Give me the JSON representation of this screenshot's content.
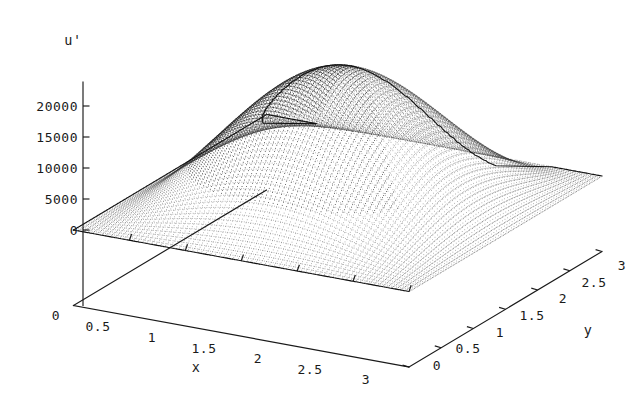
{
  "figure": {
    "kind": "3d-surface-plot",
    "style": "dotted-mesh",
    "background_color": "#ffffff",
    "ink_color": "#1a1a1a"
  },
  "zaxis": {
    "title": "u'",
    "ticks": [
      "20000",
      "15000",
      "10000",
      "5000",
      "0"
    ],
    "tick_values": [
      20000,
      15000,
      10000,
      5000,
      0
    ],
    "range": [
      0,
      20000
    ]
  },
  "xaxis": {
    "title": "x",
    "origin_label": "0",
    "ticks": [
      "0.5",
      "1",
      "1.5",
      "2",
      "2.5",
      "3"
    ],
    "tick_values": [
      0.5,
      1,
      1.5,
      2,
      2.5,
      3
    ],
    "range": [
      0,
      3
    ]
  },
  "yaxis": {
    "title": "y",
    "ticks": [
      "0",
      "0.5",
      "1",
      "1.5",
      "2",
      "2.5",
      "3"
    ],
    "tick_values": [
      0,
      0.5,
      1,
      1.5,
      2,
      2.5,
      3
    ],
    "range": [
      0,
      3
    ]
  },
  "chart_data": {
    "type": "surface",
    "title": "",
    "xlabel": "x",
    "ylabel": "y",
    "zlabel": "u'",
    "xlim": [
      0,
      3
    ],
    "ylim": [
      0,
      3
    ],
    "zlim": [
      0,
      22000
    ],
    "grid": false,
    "legend": null,
    "xticks": [
      0,
      0.5,
      1,
      1.5,
      2,
      2.5,
      3
    ],
    "yticks": [
      0,
      0.5,
      1,
      1.5,
      2,
      2.5,
      3
    ],
    "zticks": [
      0,
      5000,
      10000,
      15000,
      20000
    ],
    "peak": {
      "x": 1.5,
      "y": 1.5,
      "z": 21500
    },
    "surface_note": "single smooth dome, zero on all four domain boundaries",
    "x": [
      0,
      0.25,
      0.5,
      0.75,
      1,
      1.25,
      1.5,
      1.75,
      2,
      2.25,
      2.5,
      2.75,
      3
    ],
    "y": [
      0,
      0.25,
      0.5,
      0.75,
      1,
      1.25,
      1.5,
      1.75,
      2,
      2.25,
      2.5,
      2.75,
      3
    ],
    "z": [
      [
        0,
        0,
        0,
        0,
        0,
        0,
        0,
        0,
        0,
        0,
        0,
        0,
        0
      ],
      [
        0,
        1160,
        2225,
        3115,
        3760,
        4125,
        4245,
        4125,
        3760,
        3115,
        2225,
        1160,
        0
      ],
      [
        0,
        2225,
        4270,
        5975,
        7215,
        7920,
        8150,
        7920,
        7215,
        5975,
        4270,
        2225,
        0
      ],
      [
        0,
        3115,
        5975,
        8365,
        10100,
        11085,
        11410,
        11085,
        10100,
        8365,
        5975,
        3115,
        0
      ],
      [
        0,
        3760,
        7215,
        10100,
        12195,
        13385,
        13775,
        13385,
        12195,
        10100,
        7215,
        3760,
        0
      ],
      [
        0,
        4125,
        7920,
        11085,
        13385,
        14690,
        15120,
        14690,
        13385,
        11085,
        7920,
        4125,
        0
      ],
      [
        0,
        4245,
        8150,
        11410,
        13775,
        15120,
        21500,
        15120,
        13775,
        11410,
        8150,
        4245,
        0
      ],
      [
        0,
        4125,
        7920,
        11085,
        13385,
        14690,
        15120,
        14690,
        13385,
        11085,
        7920,
        4125,
        0
      ],
      [
        0,
        3760,
        7215,
        10100,
        12195,
        13385,
        13775,
        13385,
        12195,
        10100,
        7215,
        3760,
        0
      ],
      [
        0,
        3115,
        5975,
        8365,
        10100,
        11085,
        11410,
        11085,
        10100,
        8365,
        5975,
        3115,
        0
      ],
      [
        0,
        2225,
        4270,
        5975,
        7215,
        7920,
        8150,
        7920,
        7215,
        5975,
        4270,
        2225,
        0
      ],
      [
        0,
        1160,
        2225,
        3115,
        3760,
        4125,
        4245,
        4125,
        3760,
        3115,
        2225,
        1160,
        0
      ],
      [
        0,
        0,
        0,
        0,
        0,
        0,
        0,
        0,
        0,
        0,
        0,
        0,
        0
      ]
    ]
  }
}
